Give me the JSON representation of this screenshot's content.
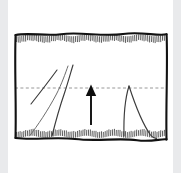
{
  "figure": {
    "background_color": "#ffffff",
    "margin_color": "#e9eaec",
    "ink_color": "#111111",
    "dash_color": "#8d8d8d",
    "curve_color": "#3b3b3b",
    "soft_curve_color": "#6d6d6d"
  },
  "chart_data": {
    "type": "line",
    "title": "",
    "subtitle": "",
    "xlabel": "",
    "ylabel": "",
    "xlim": [
      0,
      160
    ],
    "ylim": [
      0,
      116
    ],
    "grid": false,
    "legend": null,
    "annotations": [
      {
        "name": "upward-arrow",
        "kind": "arrow",
        "direction": "up",
        "x": 80,
        "y_start": 96,
        "y_end": 60,
        "label": ""
      }
    ],
    "reference_lines": [
      {
        "name": "horizontal-dashed-reference",
        "orientation": "horizontal",
        "y": 60,
        "style": "dashed",
        "color": "#8d8d8d"
      }
    ],
    "boundaries": [
      {
        "name": "top-hatched-boundary",
        "edge": "top",
        "y": 6,
        "hatched": true,
        "hatch_side": "below"
      },
      {
        "name": "bottom-hatched-boundary",
        "edge": "bottom",
        "y": 110,
        "hatched": true,
        "hatch_side": "above"
      },
      {
        "name": "left-border",
        "edge": "left",
        "x": 4,
        "hatched": false
      },
      {
        "name": "right-border",
        "edge": "right",
        "x": 156,
        "hatched": false
      }
    ],
    "series": [
      {
        "name": "upper-left-straight-segment",
        "style": "solid",
        "color": "#3b3b3b",
        "points": [
          [
            20,
            76
          ],
          [
            29,
            64
          ],
          [
            38,
            52
          ],
          [
            46,
            42
          ]
        ]
      },
      {
        "name": "left-concave-rising-curve",
        "style": "solid",
        "color": "#6d6d6d",
        "points": [
          [
            18,
            108
          ],
          [
            26,
            98
          ],
          [
            34,
            86
          ],
          [
            42,
            72
          ],
          [
            49,
            58
          ],
          [
            54,
            46
          ],
          [
            57,
            38
          ]
        ]
      },
      {
        "name": "left-steep-rising-curve",
        "style": "solid",
        "color": "#3b3b3b",
        "points": [
          [
            41,
            108
          ],
          [
            45,
            96
          ],
          [
            49,
            82
          ],
          [
            53,
            68
          ],
          [
            57,
            54
          ],
          [
            60,
            43
          ],
          [
            62,
            37
          ]
        ]
      },
      {
        "name": "right-spike-rising-edge",
        "style": "solid",
        "color": "#3b3b3b",
        "points": [
          [
            113,
            108
          ],
          [
            113,
            92
          ],
          [
            114,
            76
          ],
          [
            116,
            64
          ],
          [
            118,
            58
          ]
        ]
      },
      {
        "name": "right-spike-falling-edge",
        "style": "solid",
        "color": "#3b3b3b",
        "points": [
          [
            118,
            58
          ],
          [
            122,
            72
          ],
          [
            127,
            86
          ],
          [
            133,
            99
          ],
          [
            139,
            107
          ],
          [
            145,
            110
          ]
        ]
      }
    ]
  }
}
